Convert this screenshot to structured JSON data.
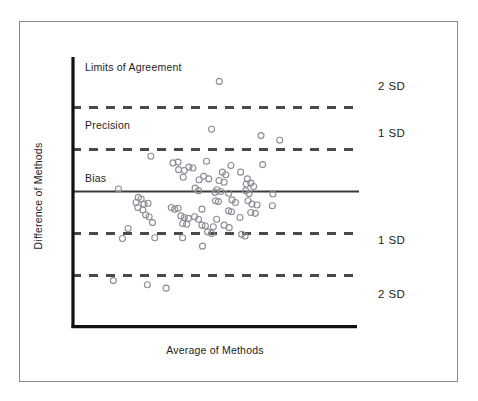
{
  "figure": {
    "type": "bland-altman-plot",
    "background_color": "#ffffff",
    "frame_border_color": "#8a8a8a"
  },
  "axes": {
    "x_title": "Average of Methods",
    "y_title": "Difference of Methods",
    "axis_color": "#111111"
  },
  "annotations": {
    "limits_of_agreement": "Limits of Agreement",
    "precision": "Precision",
    "bias": "Bias"
  },
  "sd_labels": {
    "upper_2sd": "2 SD",
    "upper_1sd": "1 SD",
    "lower_1sd": "1 SD",
    "lower_2sd": "2 SD"
  },
  "chart_data": {
    "type": "scatter",
    "title": "",
    "xlabel": "Average of Methods",
    "ylabel": "Difference of Methods",
    "xlim": [
      0,
      10
    ],
    "ylim": [
      -3.2,
      3.2
    ],
    "grid": false,
    "legend": "none",
    "marker": {
      "shape": "open-circle",
      "edge_color": "#8c8c96",
      "fill": "none",
      "size_px": 6
    },
    "reference_lines": [
      {
        "name": "upper_2sd",
        "label": "2 SD",
        "y": 2.0,
        "style": "dashed",
        "color": "#4a4a4a"
      },
      {
        "name": "upper_1sd",
        "label": "1 SD",
        "y": 1.0,
        "style": "dashed",
        "color": "#4a4a4a"
      },
      {
        "name": "bias",
        "label": "Bias",
        "y": 0.0,
        "style": "solid",
        "color": "#3b3b3b"
      },
      {
        "name": "lower_1sd",
        "label": "1 SD",
        "y": -1.0,
        "style": "dashed",
        "color": "#4a4a4a"
      },
      {
        "name": "lower_2sd",
        "label": "2 SD",
        "y": -2.0,
        "style": "dashed",
        "color": "#4a4a4a"
      }
    ],
    "text_annotations": [
      {
        "text": "Limits of Agreement",
        "x": 0.5,
        "y": 2.45
      },
      {
        "text": "Precision",
        "x": 0.5,
        "y": 1.45
      },
      {
        "text": "Bias",
        "x": 0.5,
        "y": 0.42
      }
    ],
    "points": [
      {
        "x": 5.15,
        "y": 2.62
      },
      {
        "x": 4.88,
        "y": 1.48
      },
      {
        "x": 6.62,
        "y": 1.33
      },
      {
        "x": 7.28,
        "y": 1.22
      },
      {
        "x": 2.74,
        "y": 0.84
      },
      {
        "x": 3.52,
        "y": 0.68
      },
      {
        "x": 3.7,
        "y": 0.7
      },
      {
        "x": 4.7,
        "y": 0.72
      },
      {
        "x": 5.56,
        "y": 0.62
      },
      {
        "x": 6.68,
        "y": 0.64
      },
      {
        "x": 3.72,
        "y": 0.52
      },
      {
        "x": 3.92,
        "y": 0.5
      },
      {
        "x": 4.08,
        "y": 0.58
      },
      {
        "x": 4.22,
        "y": 0.56
      },
      {
        "x": 5.26,
        "y": 0.46
      },
      {
        "x": 5.38,
        "y": 0.4
      },
      {
        "x": 5.9,
        "y": 0.46
      },
      {
        "x": 6.14,
        "y": 0.3
      },
      {
        "x": 3.88,
        "y": 0.34
      },
      {
        "x": 4.44,
        "y": 0.28
      },
      {
        "x": 4.6,
        "y": 0.36
      },
      {
        "x": 4.78,
        "y": 0.3
      },
      {
        "x": 5.14,
        "y": 0.26
      },
      {
        "x": 5.32,
        "y": 0.22
      },
      {
        "x": 6.1,
        "y": 0.18
      },
      {
        "x": 6.26,
        "y": 0.2
      },
      {
        "x": 6.36,
        "y": 0.12
      },
      {
        "x": 1.6,
        "y": 0.06
      },
      {
        "x": 4.3,
        "y": 0.08
      },
      {
        "x": 4.42,
        "y": 0.02
      },
      {
        "x": 5.06,
        "y": 0.04
      },
      {
        "x": 5.0,
        "y": -0.02
      },
      {
        "x": 5.2,
        "y": 0.0
      },
      {
        "x": 5.48,
        "y": -0.04
      },
      {
        "x": 6.08,
        "y": 0.02
      },
      {
        "x": 6.2,
        "y": -0.05
      },
      {
        "x": 7.04,
        "y": -0.06
      },
      {
        "x": 2.3,
        "y": -0.14
      },
      {
        "x": 2.4,
        "y": -0.18
      },
      {
        "x": 2.22,
        "y": -0.26
      },
      {
        "x": 2.5,
        "y": -0.3
      },
      {
        "x": 2.64,
        "y": -0.28
      },
      {
        "x": 5.02,
        "y": -0.22
      },
      {
        "x": 5.12,
        "y": -0.24
      },
      {
        "x": 5.6,
        "y": -0.2
      },
      {
        "x": 5.72,
        "y": -0.26
      },
      {
        "x": 6.16,
        "y": -0.22
      },
      {
        "x": 6.3,
        "y": -0.3
      },
      {
        "x": 6.48,
        "y": -0.32
      },
      {
        "x": 7.02,
        "y": -0.34
      },
      {
        "x": 2.28,
        "y": -0.38
      },
      {
        "x": 2.46,
        "y": -0.44
      },
      {
        "x": 3.46,
        "y": -0.38
      },
      {
        "x": 3.58,
        "y": -0.42
      },
      {
        "x": 3.7,
        "y": -0.4
      },
      {
        "x": 4.54,
        "y": -0.42
      },
      {
        "x": 5.48,
        "y": -0.46
      },
      {
        "x": 5.58,
        "y": -0.48
      },
      {
        "x": 6.26,
        "y": -0.5
      },
      {
        "x": 6.42,
        "y": -0.52
      },
      {
        "x": 2.56,
        "y": -0.56
      },
      {
        "x": 2.68,
        "y": -0.6
      },
      {
        "x": 3.8,
        "y": -0.58
      },
      {
        "x": 3.92,
        "y": -0.62
      },
      {
        "x": 4.06,
        "y": -0.64
      },
      {
        "x": 4.28,
        "y": -0.6
      },
      {
        "x": 4.42,
        "y": -0.66
      },
      {
        "x": 5.06,
        "y": -0.66
      },
      {
        "x": 5.88,
        "y": -0.62
      },
      {
        "x": 2.8,
        "y": -0.74
      },
      {
        "x": 3.86,
        "y": -0.76
      },
      {
        "x": 4.0,
        "y": -0.78
      },
      {
        "x": 4.54,
        "y": -0.8
      },
      {
        "x": 4.66,
        "y": -0.82
      },
      {
        "x": 4.94,
        "y": -0.84
      },
      {
        "x": 5.32,
        "y": -0.8
      },
      {
        "x": 5.5,
        "y": -0.86
      },
      {
        "x": 1.94,
        "y": -0.88
      },
      {
        "x": 4.74,
        "y": -0.96
      },
      {
        "x": 4.88,
        "y": -1.0
      },
      {
        "x": 5.94,
        "y": -1.02
      },
      {
        "x": 6.06,
        "y": -1.06
      },
      {
        "x": 1.74,
        "y": -1.12
      },
      {
        "x": 2.88,
        "y": -1.1
      },
      {
        "x": 3.86,
        "y": -1.1
      },
      {
        "x": 4.56,
        "y": -1.3
      },
      {
        "x": 1.42,
        "y": -2.12
      },
      {
        "x": 2.62,
        "y": -2.22
      },
      {
        "x": 3.28,
        "y": -2.3
      }
    ]
  }
}
